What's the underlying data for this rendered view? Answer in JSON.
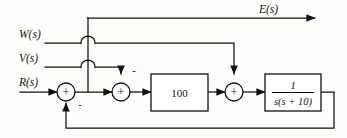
{
  "diagram": {
    "type": "control-system-block-diagram",
    "title": "",
    "inputs": [
      {
        "id": "e_out",
        "label": "E(s)",
        "role": "output-signal",
        "x": 259,
        "y": 13
      },
      {
        "id": "w_in",
        "label": "W(s)",
        "role": "disturbance-input",
        "x": 19,
        "y": 40
      },
      {
        "id": "v_in",
        "label": "V(s)",
        "role": "disturbance-input",
        "x": 19,
        "y": 64
      },
      {
        "id": "r_in",
        "label": "R(s)",
        "role": "reference-input",
        "x": 19,
        "y": 88
      }
    ],
    "summing_junctions": [
      {
        "id": "sum1",
        "inside_sign": "+",
        "secondary_sign": "-",
        "secondary_position": "bottom",
        "cx": 66,
        "cy": 92,
        "r": 9
      },
      {
        "id": "sum2",
        "inside_sign": "+",
        "secondary_sign": "-",
        "secondary_position": "top",
        "cx": 121,
        "cy": 92,
        "r": 9
      },
      {
        "id": "sum3",
        "inside_sign": "+",
        "secondary_sign": "",
        "secondary_position": "",
        "cx": 234,
        "cy": 92,
        "r": 9
      }
    ],
    "blocks": [
      {
        "id": "gain_block",
        "kind": "gain",
        "label": "100",
        "x": 151,
        "y": 74,
        "w": 57,
        "h": 37
      },
      {
        "id": "plant_block",
        "kind": "transfer-function",
        "numerator": "1",
        "denominator": "s(s + 10)",
        "label": "1 / s(s + 10)",
        "x": 265,
        "y": 74,
        "w": 56,
        "h": 37
      }
    ],
    "wire_hops": [
      {
        "id": "hop_w",
        "x": 88,
        "y": 43,
        "r": 7
      },
      {
        "id": "hop_v",
        "x": 88,
        "y": 67,
        "r": 7
      }
    ],
    "feedback": {
      "id": "unity-feedback",
      "from": "plant_block-output",
      "to": "sum1",
      "sign": "-",
      "y": 128
    },
    "takeoff": {
      "id": "error-takeoff",
      "x": 88,
      "from_y": 92,
      "to_y": 18
    }
  },
  "colors": {
    "line": "#14110f",
    "background": "#fdfdfb",
    "fill": "#ffffff"
  }
}
